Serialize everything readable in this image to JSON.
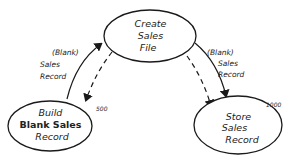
{
  "diagram": {
    "nodes": [
      {
        "id": "create",
        "lines": [
          "Create",
          "Sales",
          "File"
        ],
        "count": ""
      },
      {
        "id": "build",
        "lines": [
          "Build",
          "Blank Sales",
          "Record"
        ],
        "count": "500"
      },
      {
        "id": "store",
        "lines": [
          "Store",
          "Sales",
          "Record"
        ],
        "count": "1000"
      }
    ],
    "edges": [
      {
        "from": "build",
        "to": "create",
        "style": "solid",
        "label_lines": [
          "(Blank)",
          "Sales",
          "Record"
        ]
      },
      {
        "from": "create",
        "to": "build",
        "style": "dashed",
        "label_lines": []
      },
      {
        "from": "create",
        "to": "store",
        "style": "dashed",
        "label_lines": []
      },
      {
        "from": "create",
        "to": "store",
        "style": "solid",
        "label_lines": [
          "(Blank)",
          "Sales",
          "Record"
        ]
      }
    ],
    "colors": {
      "ink": "#1a1a1a",
      "background": "#ffffff"
    }
  }
}
